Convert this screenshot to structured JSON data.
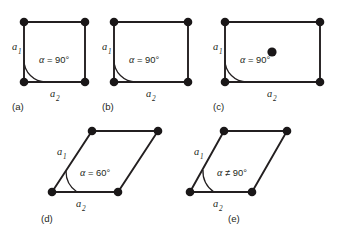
{
  "figure": {
    "background_color": "#ffffff",
    "line_color": "#231f20",
    "node_color": "#1a1718"
  },
  "panels": [
    {
      "id": "a",
      "caption": "(a)",
      "lattice_name": "square",
      "a1_label": "a",
      "a1_sub": "1",
      "a2_label": "a",
      "a2_sub": "2",
      "angle_alpha": "α",
      "angle_value": "= 90°",
      "centered": false,
      "node_count": 4
    },
    {
      "id": "b",
      "caption": "(b)",
      "lattice_name": "primitive rectangular",
      "a1_label": "a",
      "a1_sub": "1",
      "a2_label": "a",
      "a2_sub": "2",
      "angle_alpha": "α",
      "angle_value": "= 90°",
      "centered": false,
      "node_count": 4
    },
    {
      "id": "c",
      "caption": "(c)",
      "lattice_name": "centered rectangular",
      "a1_label": "a",
      "a1_sub": "1",
      "a2_label": "a",
      "a2_sub": "2",
      "angle_alpha": "α",
      "angle_value": "= 90°",
      "centered": true,
      "node_count": 5
    },
    {
      "id": "d",
      "caption": "(d)",
      "lattice_name": "hexagonal",
      "a1_label": "a",
      "a1_sub": "1",
      "a2_label": "a",
      "a2_sub": "2",
      "angle_alpha": "α",
      "angle_value": "= 60°",
      "centered": false,
      "node_count": 4
    },
    {
      "id": "e",
      "caption": "(e)",
      "lattice_name": "oblique",
      "a1_label": "a",
      "a1_sub": "1",
      "a2_label": "a",
      "a2_sub": "2",
      "angle_alpha": "α",
      "angle_value": "≠ 90°",
      "centered": false,
      "node_count": 4
    }
  ]
}
